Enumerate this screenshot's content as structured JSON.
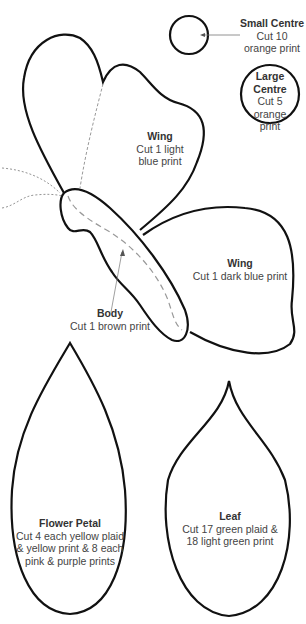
{
  "pieces": {
    "small_centre": {
      "name": "Small Centre",
      "lines": [
        "Cut 10",
        "orange print"
      ]
    },
    "large_centre": {
      "name": "Large Centre",
      "name_lines": [
        "Large",
        "Centre"
      ],
      "lines": [
        "Cut 5",
        "orange",
        "print"
      ]
    },
    "wing_upper": {
      "name": "Wing",
      "lines": [
        "Cut 1 light",
        "blue print"
      ]
    },
    "wing_lower": {
      "name": "Wing",
      "lines": [
        "Cut 1 dark blue print"
      ]
    },
    "body": {
      "name": "Body",
      "lines": [
        "Cut 1 brown print"
      ]
    },
    "flower_petal": {
      "name": "Flower Petal",
      "lines": [
        "Cut 4 each yellow plaid",
        "& yellow print & 8 each",
        "pink & purple prints"
      ]
    },
    "leaf": {
      "name": "Leaf",
      "lines": [
        "Cut 17 green plaid &",
        "18 light green print"
      ]
    }
  },
  "colors": {
    "outline": "#111111",
    "dashed": "#9a9a9a",
    "text": "#444444"
  }
}
